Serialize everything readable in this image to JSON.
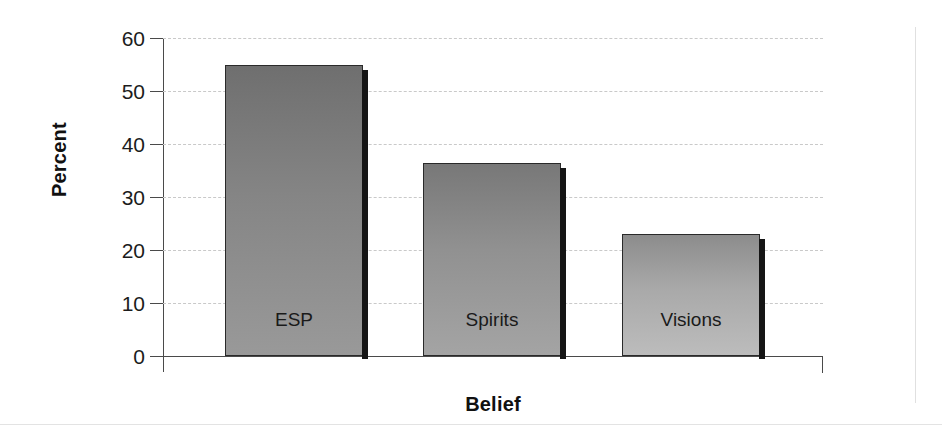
{
  "chart_data": {
    "type": "bar",
    "title": "",
    "subtitle": "",
    "xlabel": "Belief",
    "ylabel": "Percent",
    "categories": [
      "ESP",
      "Spirits",
      "Visions"
    ],
    "values": [
      55,
      36.5,
      23
    ],
    "series": [
      {
        "name": "Percent",
        "values": [
          55,
          36.5,
          23
        ]
      }
    ],
    "ylim": [
      0,
      60
    ],
    "yticks": [
      0,
      10,
      20,
      30,
      40,
      50,
      60
    ],
    "ytick_labels": [
      "0",
      "10",
      "20",
      "30",
      "40",
      "50",
      "60"
    ],
    "grid": "horizontal-dashed",
    "legend": "none",
    "bar_label_position": "inside-bottom",
    "bar_fill_style": "vertical-gradient-gray",
    "bar_colors": [
      "#8e8e8e",
      "#9a9a9a",
      "#b4b4b4"
    ],
    "bar_edge_color": "#2a2a2a",
    "bar_shadow_color": "#151515",
    "axis_color": "#4a4a4a",
    "gridline_color": "#c9c9c9",
    "background_color": "#ffffff",
    "text_color": "#1c1c1c"
  }
}
